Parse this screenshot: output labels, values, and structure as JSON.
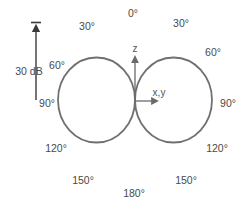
{
  "diagram": {
    "type": "polar radiation pattern (figure-eight / dipole)",
    "scale_label": "30 dB",
    "axis_labels": {
      "z": "z",
      "xy": "x,y"
    },
    "angle_labels": {
      "top_0": "0°",
      "left_30": "30°",
      "right_30": "30°",
      "left_60": "60°",
      "right_60": "60°",
      "left_90": "90°",
      "right_90": "90°",
      "left_120": "120°",
      "right_120": "120°",
      "left_150": "150°",
      "right_150": "150°",
      "bottom_180": "180°"
    },
    "colors": {
      "lobe_stroke": "#707070",
      "arrow": "#3a3a3a",
      "text": "#4a4a4a"
    },
    "lobes": [
      {
        "name": "left-lobe",
        "direction_deg": 90,
        "side": "left"
      },
      {
        "name": "right-lobe",
        "direction_deg": 90,
        "side": "right"
      }
    ]
  }
}
